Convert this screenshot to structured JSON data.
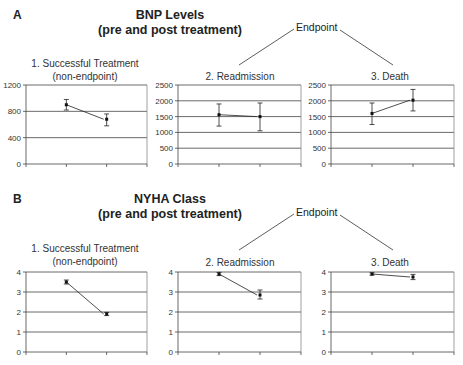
{
  "sections": [
    {
      "letter": "A",
      "title_line1": "BNP Levels",
      "title_line2": "(pre and post treatment)",
      "endpoint_label": "Endpoint",
      "panels": [
        {
          "title_line1": "1. Successful Treatment",
          "title_line2": "(non-endpoint)"
        },
        {
          "title_line1": "2. Readmission",
          "title_line2": ""
        },
        {
          "title_line1": "3. Death",
          "title_line2": ""
        }
      ]
    },
    {
      "letter": "B",
      "title_line1": "NYHA Class",
      "title_line2": "(pre and post treatment)",
      "endpoint_label": "Endpoint",
      "panels": [
        {
          "title_line1": "1. Successful Treatment",
          "title_line2": "(non-endpoint)"
        },
        {
          "title_line1": "2. Readmission",
          "title_line2": ""
        },
        {
          "title_line1": "3. Death",
          "title_line2": ""
        }
      ]
    }
  ],
  "chart_data": [
    {
      "type": "line",
      "section": "A",
      "title": "1. Successful Treatment (non-endpoint)",
      "categories": [
        "pre",
        "post"
      ],
      "values": [
        900,
        680
      ],
      "error_low": [
        820,
        580
      ],
      "error_high": [
        980,
        760
      ],
      "ylim": [
        0,
        1200
      ],
      "yticks": [
        0,
        400,
        800,
        1200
      ],
      "grid": true
    },
    {
      "type": "line",
      "section": "A",
      "title": "2. Readmission",
      "categories": [
        "pre",
        "post"
      ],
      "values": [
        1560,
        1500
      ],
      "error_low": [
        1200,
        1050
      ],
      "error_high": [
        1900,
        1930
      ],
      "ylim": [
        0,
        2500
      ],
      "yticks": [
        0,
        500,
        1000,
        1500,
        2000,
        2500
      ],
      "grid": true
    },
    {
      "type": "line",
      "section": "A",
      "title": "3. Death",
      "categories": [
        "pre",
        "post"
      ],
      "values": [
        1600,
        2020
      ],
      "error_low": [
        1250,
        1680
      ],
      "error_high": [
        1930,
        2360
      ],
      "ylim": [
        0,
        2500
      ],
      "yticks": [
        0,
        500,
        1000,
        1500,
        2000,
        2500
      ],
      "grid": true
    },
    {
      "type": "line",
      "section": "B",
      "title": "1. Successful Treatment (non-endpoint)",
      "categories": [
        "pre",
        "post"
      ],
      "values": [
        3.5,
        1.9
      ],
      "error_low": [
        3.4,
        1.82
      ],
      "error_high": [
        3.6,
        1.98
      ],
      "ylim": [
        0,
        4
      ],
      "yticks": [
        0,
        1,
        2,
        3,
        4
      ],
      "grid": true
    },
    {
      "type": "line",
      "section": "B",
      "title": "2. Readmission",
      "categories": [
        "pre",
        "post"
      ],
      "values": [
        3.9,
        2.85
      ],
      "error_low": [
        3.82,
        2.65
      ],
      "error_high": [
        3.98,
        3.1
      ],
      "ylim": [
        0,
        4
      ],
      "yticks": [
        0,
        1,
        2,
        3,
        4
      ],
      "grid": true
    },
    {
      "type": "line",
      "section": "B",
      "title": "3. Death",
      "categories": [
        "pre",
        "post"
      ],
      "values": [
        3.9,
        3.75
      ],
      "error_low": [
        3.84,
        3.62
      ],
      "error_high": [
        3.96,
        3.88
      ],
      "ylim": [
        0,
        4
      ],
      "yticks": [
        0,
        1,
        2,
        3,
        4
      ],
      "grid": true
    }
  ]
}
